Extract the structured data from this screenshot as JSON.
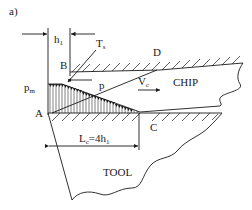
{
  "figure": {
    "panel_label": "a)",
    "labels": {
      "h1": "h",
      "h1_sub": "1",
      "Ts": "T",
      "Ts_sub": "s",
      "B": "B",
      "D": "D",
      "pm": "p",
      "pm_sub": "m",
      "p": "p",
      "Vc": "V",
      "Vc_sub": "c",
      "chip": "CHIP",
      "A": "A",
      "C": "C",
      "Lc": "L",
      "Lc_sub": "c",
      "Lc_eq": "=4h",
      "Lc_eq_sub": "1",
      "tool": "TOOL"
    },
    "colors": {
      "stroke": "#1a1a1a",
      "background": "#ffffff"
    }
  }
}
